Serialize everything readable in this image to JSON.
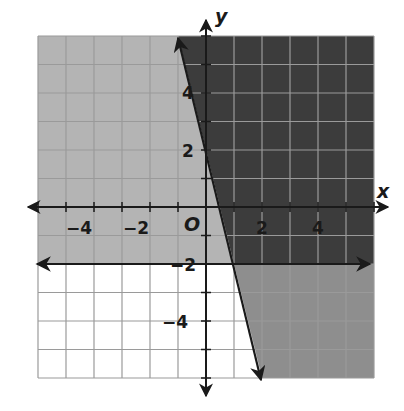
{
  "chart_data": {
    "type": "line",
    "title": "",
    "xlabel": "x",
    "ylabel": "y",
    "origin_label": "O",
    "xlim": [
      -6,
      6
    ],
    "ylim": [
      -6,
      6
    ],
    "grid": true,
    "x_tick_labels": [
      "−4",
      "−2",
      "2",
      "4"
    ],
    "y_tick_labels": [
      "4",
      "2",
      "−2",
      "−4"
    ],
    "lines": [
      {
        "name": "boundary-steep",
        "equation": "y = -4x + 2",
        "points": [
          [
            -1,
            6
          ],
          [
            2,
            -6
          ]
        ],
        "style": "solid",
        "arrows": "both"
      },
      {
        "name": "boundary-horizontal",
        "equation": "y = -2",
        "points": [
          [
            -6,
            -2
          ],
          [
            6,
            -2
          ]
        ],
        "style": "solid",
        "arrows": "both"
      }
    ],
    "regions": [
      {
        "name": "solution-overlap",
        "description": "y > -4x + 2 and y > -2",
        "color": "#3c3c3c"
      },
      {
        "name": "only-horizontal",
        "description": "y < -4x + 2 and y > -2",
        "color": "#b4b4b4"
      },
      {
        "name": "only-steep",
        "description": "y > -4x + 2 and y < -2",
        "color": "#8e8e8e"
      },
      {
        "name": "neither",
        "description": "y < -4x + 2 and y < -2",
        "color": "#ffffff"
      }
    ]
  },
  "labels": {
    "x_axis": "x",
    "y_axis": "y",
    "origin": "O",
    "xt_m4": "−4",
    "xt_m2": "−2",
    "xt_2": "2",
    "xt_4": "4",
    "yt_4": "4",
    "yt_2": "2",
    "yt_m2": "−2",
    "yt_m4": "−4"
  },
  "colors": {
    "dark": "#3c3c3c",
    "light": "#b4b4b4",
    "medium": "#8e8e8e",
    "grid_on_light": "#9a9a9a",
    "grid_on_dark": "#8a8a8a",
    "axis": "#1a1a1a"
  }
}
